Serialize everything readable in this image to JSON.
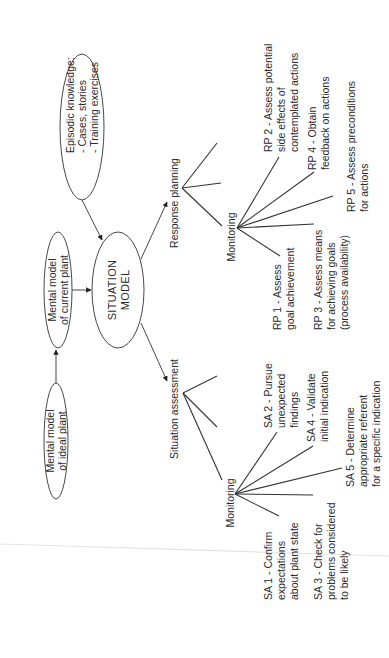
{
  "diagram": {
    "title": "",
    "orientation": "rotated-90-ccw",
    "nodes": {
      "ideal_plant": {
        "lines": [
          "Mental model",
          "of ideal plant"
        ]
      },
      "current_plant": {
        "lines": [
          "Mental model",
          "of current plant"
        ]
      },
      "situation_model": {
        "lines": [
          "SITUATION",
          "MODEL"
        ]
      },
      "episodic": {
        "lines": [
          "Episodic knowledge:",
          "- Cases, stories",
          "- Training exercises"
        ]
      }
    },
    "branches": {
      "response_planning": {
        "label": "Response planning",
        "monitoring_label": "Monitoring",
        "items": [
          {
            "id": "RP1",
            "lines": [
              "RP 1 - Assess",
              "goal achievement"
            ]
          },
          {
            "id": "RP2",
            "lines": [
              "RP 2 - Assess potential",
              "side effects of",
              "contemplated actions"
            ]
          },
          {
            "id": "RP3",
            "lines": [
              "RP 3 - Assess means",
              "for achieving goals",
              "(process availability)"
            ]
          },
          {
            "id": "RP4",
            "lines": [
              "RP 4 - Obtain",
              "feedback on actions"
            ]
          },
          {
            "id": "RP5",
            "lines": [
              "RP 5 - Assess preconditions",
              "for actions"
            ]
          }
        ]
      },
      "situation_assessment": {
        "label": "Situation assessment",
        "monitoring_label": "Monitoring",
        "items": [
          {
            "id": "SA1",
            "lines": [
              "SA 1 - Confirm",
              "expectations",
              "about plant state"
            ]
          },
          {
            "id": "SA2",
            "lines": [
              "SA 2 - Pursue",
              "unexpected",
              "findings"
            ]
          },
          {
            "id": "SA3",
            "lines": [
              "SA 3 - Check for",
              "problems considered",
              "to be likely"
            ]
          },
          {
            "id": "SA4",
            "lines": [
              "SA 4 - Validate",
              "initial indication"
            ]
          },
          {
            "id": "SA5",
            "lines": [
              "SA 5 - Determine",
              "appropriate referent",
              "for a specific indication"
            ]
          }
        ]
      }
    },
    "edges": [
      {
        "from": "ideal_plant",
        "to": "current_plant"
      },
      {
        "from": "current_plant",
        "to": "situation_model"
      },
      {
        "from": "episodic",
        "to": "situation_model"
      },
      {
        "from": "situation_model",
        "to": "response_planning"
      },
      {
        "from": "situation_model",
        "to": "situation_assessment"
      }
    ],
    "colors": {
      "ink": "#2a2a2a",
      "background": "#ffffff"
    }
  }
}
